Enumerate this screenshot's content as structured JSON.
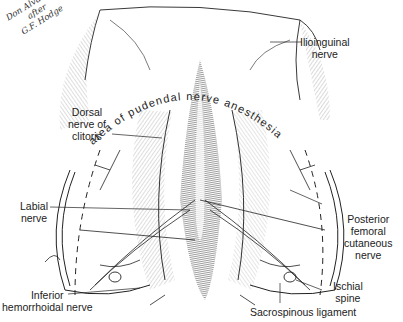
{
  "figure": {
    "credit": [
      "Don Alvarado",
      "after",
      "G.F. Hodge"
    ],
    "arc_text": "area of pudendal nerve anesthesia",
    "colors": {
      "ink": "#1a1a1a",
      "background": "#ffffff",
      "shading": "#555555"
    }
  },
  "labels": {
    "ilioinguinal": [
      "Ilioinguinal",
      "nerve"
    ],
    "dorsal_nerve": [
      "Dorsal",
      "nerve of",
      "clitoris"
    ],
    "labial": [
      "Labial",
      "nerve"
    ],
    "inferior_hemorrhoidal": [
      "Inferior",
      "hemorrhoidal nerve"
    ],
    "posterior_femoral": [
      "Posterior",
      "femoral",
      "cutaneous",
      "nerve"
    ],
    "ischial_spine": [
      "Ischial",
      "spine"
    ],
    "sacrospinous": "Sacrospinous ligament"
  }
}
